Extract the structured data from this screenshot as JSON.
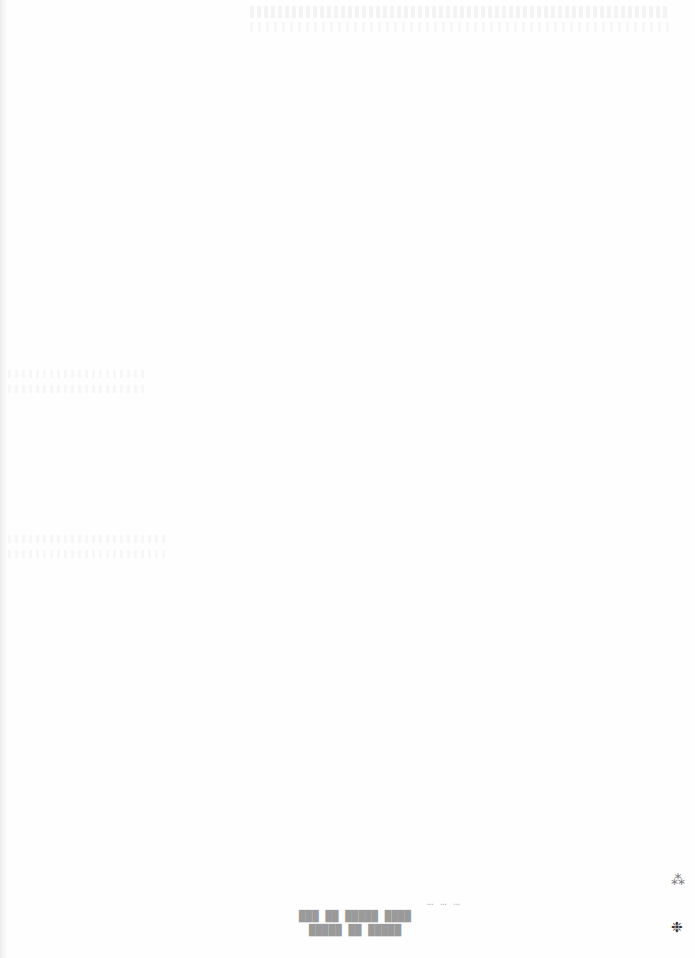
{
  "document": {
    "type": "scanned page (mostly blank, reverse-side bleed-through)",
    "background_color": "#ffffff"
  },
  "address_stamp": {
    "note": "mirrored bleed-through text, largely illegible",
    "lines": [
      "… … …",
      "████ █████ ██ ███",
      "█████ ██ █████"
    ]
  },
  "margin_marks": [
    {
      "glyph": "⁂",
      "description": "small ink mark"
    },
    {
      "glyph": "❉",
      "description": "small ink smudge"
    }
  ]
}
